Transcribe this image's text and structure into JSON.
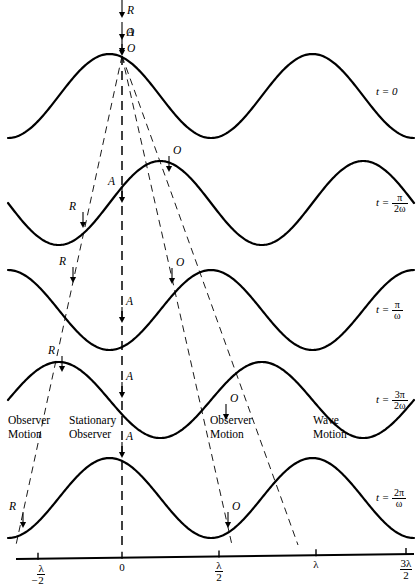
{
  "figure": {
    "stroke_color": "#000000",
    "wave_line_width": 2.2,
    "dash_line_width": 0.9
  },
  "axis": {
    "ticks": [
      {
        "label_html": "−<span class=\"frac\"><span class=\"num\">λ</span><span class=\"den\">2</span></span>",
        "value": -0.5,
        "x": 38
      },
      {
        "label_html": "0",
        "value": 0,
        "x": 122
      },
      {
        "label_html": "<span class=\"frac\"><span class=\"num\">λ</span><span class=\"den\">2</span></span>",
        "value": 0.5,
        "x": 219
      },
      {
        "label_html": "λ",
        "value": 1,
        "x": 316
      },
      {
        "label_html": "<span class=\"frac\"><span class=\"num\">3λ</span><span class=\"den\">2</span></span>",
        "value": 1.5,
        "x": 406
      }
    ],
    "unit": "λ",
    "y": 557
  },
  "rows": [
    {
      "time_label": {
        "lhs": "t",
        "eq": "=",
        "value": "0",
        "is_fraction": false
      },
      "baseline_y": 96,
      "amplitude": 42,
      "phase_deg": 0,
      "markers": [
        {
          "point": "O",
          "x": 122,
          "y": 54,
          "label_side": "right"
        }
      ]
    },
    {
      "time_label": {
        "lhs": "t",
        "eq": "=",
        "numerator": "π",
        "denominator": "2ω",
        "is_fraction": true
      },
      "baseline_y": 203,
      "amplitude": 42,
      "phase_deg": 90,
      "markers": [
        {
          "point": "R",
          "x": 83,
          "y": 228,
          "label_side": "left"
        },
        {
          "point": "A",
          "x": 122,
          "y": 203,
          "label_side": "left"
        },
        {
          "point": "O",
          "x": 169,
          "y": 172,
          "label_side": "right"
        }
      ]
    },
    {
      "time_label": {
        "lhs": "t",
        "eq": "=",
        "numerator": "π",
        "denominator": "ω",
        "is_fraction": true
      },
      "baseline_y": 310,
      "amplitude": 40,
      "phase_deg": 180,
      "markers": [
        {
          "point": "R",
          "x": 73,
          "y": 283,
          "label_side": "left"
        },
        {
          "point": "A",
          "x": 122,
          "y": 323,
          "label_side": "right"
        },
        {
          "point": "O",
          "x": 172,
          "y": 284,
          "label_side": "right"
        }
      ]
    },
    {
      "time_label": {
        "lhs": "t",
        "eq": "=",
        "numerator": "3π",
        "denominator": "2ω",
        "is_fraction": true
      },
      "baseline_y": 400,
      "amplitude": 38,
      "phase_deg": 270,
      "markers": [
        {
          "point": "R",
          "x": 62,
          "y": 372,
          "label_side": "left"
        },
        {
          "point": "A",
          "x": 122,
          "y": 398,
          "label_side": "right"
        },
        {
          "point": "O",
          "x": 226,
          "y": 420,
          "label_side": "right"
        }
      ]
    },
    {
      "time_label": {
        "lhs": "t",
        "eq": "=",
        "numerator": "2π",
        "denominator": "ω",
        "is_fraction": true
      },
      "baseline_y": 498,
      "amplitude": 40,
      "phase_deg": 0,
      "markers": [
        {
          "point": "R",
          "x": 23,
          "y": 528,
          "label_side": "left"
        },
        {
          "point": "A",
          "x": 122,
          "y": 458,
          "label_side": "right"
        },
        {
          "point": "O",
          "x": 228,
          "y": 528,
          "label_side": "right"
        }
      ]
    }
  ],
  "top_arrows": [
    {
      "point": "R",
      "x": 122,
      "y_from": 0,
      "y_to": 18
    },
    {
      "point": "A",
      "x": 122,
      "y_from": 22,
      "y_to": 40
    },
    {
      "point": "O",
      "x": 122,
      "y_from": 44,
      "y_to": 56
    }
  ],
  "trajectories": [
    {
      "name": "observer-motion-left",
      "point": "R",
      "x1": 122,
      "y1": 56,
      "x2": 16,
      "y2": 545
    },
    {
      "name": "stationary-observer",
      "point": "A",
      "x1": 122,
      "y1": 56,
      "x2": 122,
      "y2": 545
    },
    {
      "name": "observer-motion-right",
      "point": "O",
      "x1": 122,
      "y1": 56,
      "x2": 232,
      "y2": 545
    },
    {
      "name": "wave-motion",
      "point": "W",
      "x1": 122,
      "y1": 56,
      "x2": 298,
      "y2": 545
    }
  ],
  "motion_labels": [
    {
      "id": "observer-motion-left",
      "line1": "Observer",
      "line2": "Motion",
      "x": 8,
      "y": 413
    },
    {
      "id": "stationary-observer",
      "line1": "Stationary",
      "line2": "Observer",
      "x": 69,
      "y": 413
    },
    {
      "id": "observer-motion-right",
      "line1": "Observer",
      "line2": "Motion",
      "x": 210,
      "y": 413
    },
    {
      "id": "wave-motion",
      "line1": "Wave",
      "line2": "Motion",
      "x": 313,
      "y": 413
    }
  ],
  "chart_data": {
    "type": "line",
    "xlabel": "position (in units of λ)",
    "ylabel": "displacement",
    "xlim": [
      -0.5,
      1.5
    ],
    "x_tick_labels": [
      "−λ/2",
      "0",
      "λ/2",
      "λ",
      "3λ/2"
    ],
    "x_tick_values": [
      -0.5,
      0,
      0.5,
      1,
      1.5
    ],
    "grid": false,
    "legend": "right",
    "series": [
      {
        "name": "t = 0",
        "phase_deg": 0,
        "amplitude": 1,
        "wavelength": 1,
        "form": "cos(2πx/λ)"
      },
      {
        "name": "t = π/2ω",
        "phase_deg": 90,
        "amplitude": 1,
        "wavelength": 1,
        "form": "cos(2πx/λ − π/2)"
      },
      {
        "name": "t = π/ω",
        "phase_deg": 180,
        "amplitude": 1,
        "wavelength": 1,
        "form": "cos(2πx/λ − π)"
      },
      {
        "name": "t = 3π/2ω",
        "phase_deg": 270,
        "amplitude": 1,
        "wavelength": 1,
        "form": "cos(2πx/λ − 3π/2)"
      },
      {
        "name": "t = 2π/ω",
        "phase_deg": 360,
        "amplitude": 1,
        "wavelength": 1,
        "form": "cos(2πx/λ − 2π)"
      }
    ],
    "tracked_points": [
      {
        "label": "R",
        "description": "Observer moving toward source (leftward trajectory)"
      },
      {
        "label": "A",
        "description": "Stationary observer (vertical trajectory)"
      },
      {
        "label": "O",
        "description": "Observer moving away (rightward trajectory)"
      },
      {
        "label": "W",
        "description": "Wave crest motion (rightmost trajectory)"
      }
    ]
  }
}
